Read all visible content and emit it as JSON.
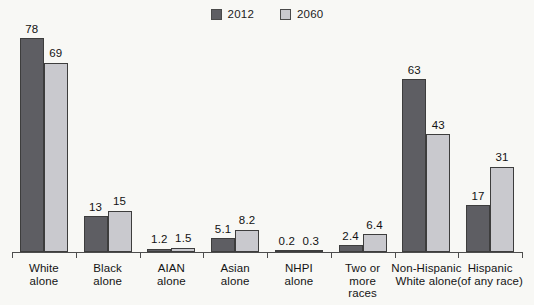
{
  "chart_data": {
    "type": "bar",
    "title": "",
    "subtitle": "",
    "xlabel": "",
    "ylabel": "",
    "ylim": [
      0,
      80
    ],
    "grid": false,
    "legend_position": "top-center",
    "categories": [
      "White alone",
      "Black alone",
      "AIAN alone",
      "Asian alone",
      "NHPI alone",
      "Two or more races",
      "Non-Hispanic White alone",
      "Hispanic (of any race)"
    ],
    "category_lines": [
      [
        "White",
        "alone"
      ],
      [
        "Black",
        "alone"
      ],
      [
        "AIAN",
        "alone"
      ],
      [
        "Asian",
        "alone"
      ],
      [
        "NHPI",
        "alone"
      ],
      [
        "Two or",
        "more",
        "races"
      ],
      [
        "Non-Hispanic",
        "White alone"
      ],
      [
        "Hispanic",
        "(of any race)"
      ]
    ],
    "series": [
      {
        "name": "2012",
        "color": "#5e5e63",
        "values": [
          78,
          13,
          1.2,
          5.1,
          0.2,
          2.4,
          63,
          17
        ],
        "labels": [
          "78",
          "13",
          "1.2",
          "5.1",
          "0.2",
          "2.4",
          "63",
          "17"
        ]
      },
      {
        "name": "2060",
        "color": "#c9c9ce",
        "values": [
          69,
          15,
          1.5,
          8.2,
          0.3,
          6.4,
          43,
          31
        ],
        "labels": [
          "69",
          "15",
          "1.5",
          "8.2",
          "0.3",
          "6.4",
          "43",
          "31"
        ]
      }
    ]
  },
  "legend": {
    "items": [
      {
        "label": "2012",
        "color": "#5e5e63"
      },
      {
        "label": "2060",
        "color": "#c9c9ce"
      }
    ]
  },
  "colors": {
    "background": "#f8f8f5",
    "series_2012": "#5e5e63",
    "series_2060": "#c9c9ce",
    "axis": "#4d4d4d",
    "text": "#141414"
  }
}
